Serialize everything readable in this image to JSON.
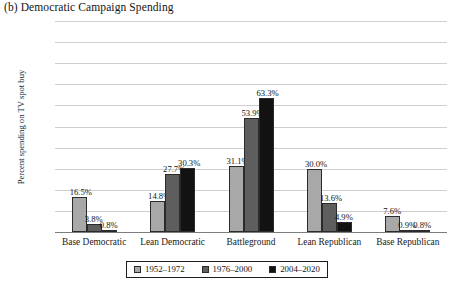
{
  "chart_data": {
    "type": "bar",
    "title": "(b) Democratic Campaign Spending",
    "xlabel": "",
    "ylabel": "Percent spending on TV spot buy",
    "ylim": [
      0,
      100
    ],
    "yticks": [
      "0%",
      "10%",
      "20%",
      "30%",
      "40%",
      "50%",
      "60%",
      "70%",
      "80%",
      "90%",
      "100%"
    ],
    "ytick_values": [
      0,
      10,
      20,
      30,
      40,
      50,
      60,
      70,
      80,
      90,
      100
    ],
    "grid": true,
    "legend_position": "bottom",
    "categories": [
      "Base Democratic",
      "Lean Democratic",
      "Battleground",
      "Lean Republican",
      "Base Republican"
    ],
    "series": [
      {
        "name": "1952–1972",
        "color": "#a8a8a8",
        "values": [
          16.5,
          14.8,
          31.1,
          30.0,
          7.6
        ],
        "labels": [
          "16.5%",
          "14.8%",
          "31.1%",
          "30.0%",
          "7.6%"
        ]
      },
      {
        "name": "1976–2000",
        "color": "#5e5e5e",
        "values": [
          3.8,
          27.7,
          53.9,
          13.6,
          0.9
        ],
        "labels": [
          "3.8%",
          "27.7%",
          "53.9%",
          "13.6%",
          "0.9%"
        ]
      },
      {
        "name": "2004–2020",
        "color": "#121212",
        "values": [
          0.8,
          30.3,
          63.3,
          4.9,
          0.8
        ],
        "labels": [
          "0.8%",
          "30.3%",
          "63.3%",
          "4.9%",
          "0.8%"
        ]
      }
    ]
  }
}
